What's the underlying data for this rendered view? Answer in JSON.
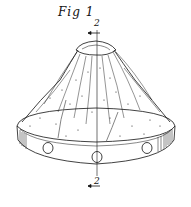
{
  "figure": {
    "title": "Fig 1",
    "section_ref_top": "2",
    "section_ref_bottom": "2",
    "colors": {
      "ink": "#111111",
      "background": "#ffffff"
    }
  }
}
